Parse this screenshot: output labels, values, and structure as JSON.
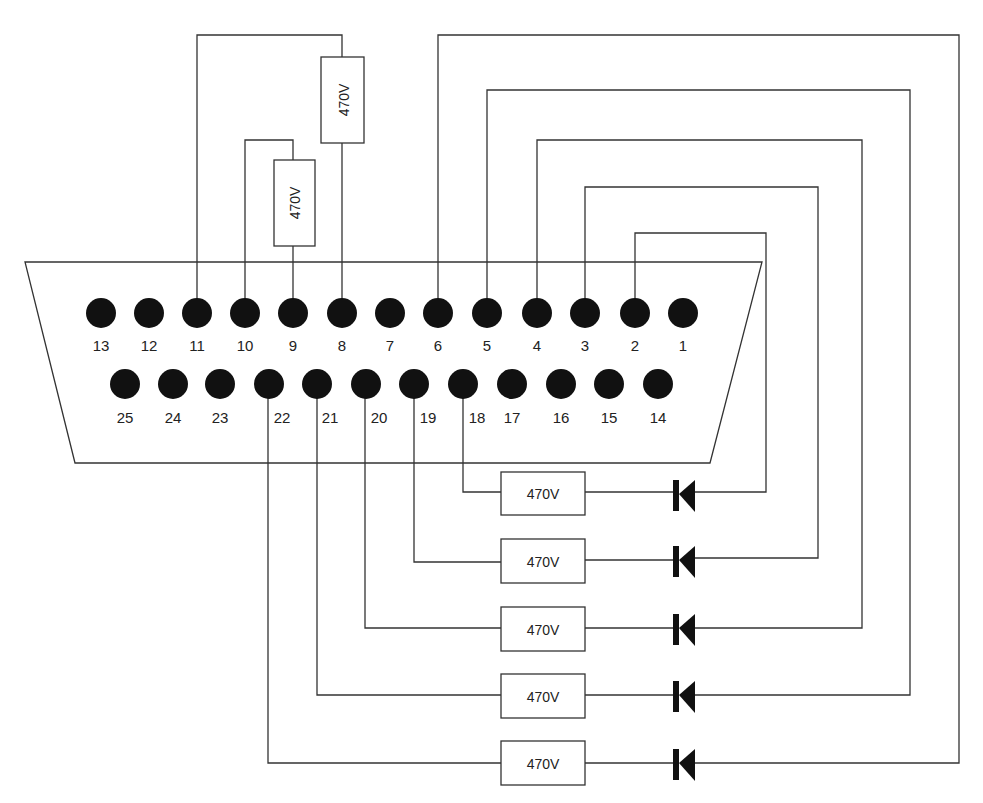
{
  "diagram": {
    "type": "DB-25 parallel port loopback wiring",
    "connector": {
      "top_row_pins": [
        13,
        12,
        11,
        10,
        9,
        8,
        7,
        6,
        5,
        4,
        3,
        2,
        1
      ],
      "bottom_row_pins": [
        25,
        24,
        23,
        22,
        21,
        20,
        19,
        18,
        17,
        16,
        15,
        14
      ]
    },
    "top_resistors": [
      {
        "label": "470V",
        "from_pin": 11,
        "to_pin": 8
      },
      {
        "label": "470V",
        "from_pin": 10,
        "to_pin": 9
      }
    ],
    "loopback_rows": [
      {
        "resistor_label": "470V",
        "resistor_pin": 18,
        "diode_pin": 2
      },
      {
        "resistor_label": "470V",
        "resistor_pin": 19,
        "diode_pin": 3
      },
      {
        "resistor_label": "470V",
        "resistor_pin": 20,
        "diode_pin": 4
      },
      {
        "resistor_label": "470V",
        "resistor_pin": 21,
        "diode_pin": 5
      },
      {
        "resistor_label": "470V",
        "resistor_pin": 22,
        "diode_pin": 6
      }
    ],
    "colors": {
      "line": "#333333",
      "pin": "#111111",
      "background": "#ffffff"
    }
  }
}
